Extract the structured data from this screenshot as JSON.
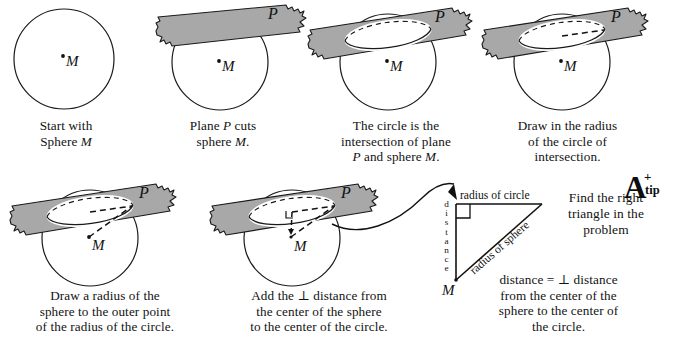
{
  "notation": {
    "sphere_center": "M",
    "plane": "P",
    "perp_symbol": "⊥"
  },
  "colors": {
    "plane_fill": "#a8a8a8",
    "stroke": "#1a1a1a",
    "text": "#121212",
    "page": "#ffffff"
  },
  "panels": [
    {
      "id": "panel-1",
      "index": 1,
      "caption_lines": [
        "Start with",
        "Sphere M"
      ],
      "caption_text": "Start with Sphere M",
      "shows": [
        "sphere-circle",
        "center-point-M"
      ],
      "has_plane": false,
      "has_ellipse": false,
      "labels": {
        "center": "M"
      }
    },
    {
      "id": "panel-2",
      "index": 2,
      "caption_lines": [
        "Plane P cuts",
        "sphere M."
      ],
      "caption_text": "Plane P cuts sphere M.",
      "shows": [
        "sphere-circle",
        "center-point-M",
        "cutting-plane",
        "hidden-arc-dashed"
      ],
      "has_plane": true,
      "has_ellipse": false,
      "labels": {
        "center": "M",
        "plane": "P"
      }
    },
    {
      "id": "panel-3",
      "index": 3,
      "caption_lines": [
        "The circle is the",
        "intersection of plane",
        "P and sphere M."
      ],
      "caption_text": "The circle is the intersection of plane P and sphere M.",
      "shows": [
        "sphere-circle",
        "center-point-M",
        "cutting-plane",
        "intersection-ellipse"
      ],
      "has_plane": true,
      "has_ellipse": true,
      "labels": {
        "center": "M",
        "plane": "P"
      }
    },
    {
      "id": "panel-4",
      "index": 4,
      "caption_lines": [
        "Draw in the radius",
        "of the circle of",
        "intersection."
      ],
      "caption_text": "Draw in the radius of the circle of intersection.",
      "shows": [
        "sphere-circle",
        "center-point-M",
        "cutting-plane",
        "intersection-ellipse",
        "circle-radius-dashed"
      ],
      "has_plane": true,
      "has_ellipse": true,
      "labels": {
        "center": "M",
        "plane": "P"
      }
    },
    {
      "id": "panel-5",
      "index": 5,
      "caption_lines": [
        "Draw a radius of the",
        "sphere to the outer point",
        "of the radius of the circle."
      ],
      "caption_text": "Draw a radius of the sphere to the outer point of the radius of the circle.",
      "shows": [
        "sphere-circle",
        "center-point-M",
        "cutting-plane",
        "intersection-ellipse",
        "circle-radius-dashed",
        "sphere-radius-dashed"
      ],
      "has_plane": true,
      "has_ellipse": true,
      "labels": {
        "center": "M",
        "plane": "P"
      }
    },
    {
      "id": "panel-6",
      "index": 6,
      "caption_lines": [
        "Add the ⊥ distance from",
        "the center of the sphere",
        "to the center of the circle."
      ],
      "caption_text": "Add the ⊥ distance from the center of the sphere to the center of the circle.",
      "shows": [
        "sphere-circle",
        "center-point-M",
        "cutting-plane",
        "intersection-ellipse",
        "circle-radius-dashed",
        "sphere-radius-dashed",
        "perpendicular-distance-dashed",
        "right-angle-mark"
      ],
      "has_plane": true,
      "has_ellipse": true,
      "labels": {
        "center": "M",
        "plane": "P"
      }
    }
  ],
  "triangle": {
    "id": "right-triangle-detail",
    "vertex_label": "M",
    "leg_vertical_label": "distance",
    "leg_vertical_letters": [
      "d",
      "i",
      "s",
      "t",
      "a",
      "n",
      "c",
      "e"
    ],
    "leg_horizontal_label": "radius of circle",
    "hypotenuse_label": "radius of sphere",
    "right_angle_mark": true
  },
  "callout": {
    "heading_lines": [
      "Find the right",
      "triangle in the",
      "problem"
    ],
    "heading_text": "Find the right triangle in the problem",
    "note_lines": [
      "distance = ⊥ distance",
      "from the center of the",
      "sphere to the center of",
      "the circle."
    ],
    "note_text": "distance = ⊥ distance from the center of the sphere to the center of the circle.",
    "arrow": "curved-arrow-to-triangle"
  },
  "badge": {
    "letter": "A",
    "plus": "+",
    "tip": "tip",
    "full": "A+ tip"
  }
}
